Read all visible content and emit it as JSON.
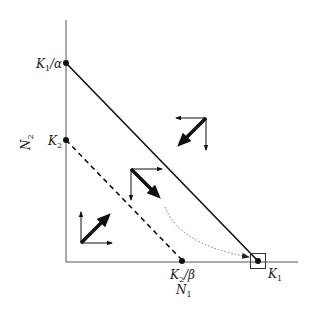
{
  "diagram": {
    "type": "phase-plane",
    "colors": {
      "ink": "#111111",
      "axis": "#555555",
      "dotted": "#666666"
    },
    "axes": {
      "x_label": {
        "main": "N",
        "sub": "1"
      },
      "y_label": {
        "main": "N",
        "sub": "2"
      }
    },
    "points": {
      "k1_over_alpha": {
        "main": "K",
        "sub": "1",
        "tail": "/α"
      },
      "k2": {
        "main": "K",
        "sub": "2"
      },
      "k2_over_beta": {
        "main": "K",
        "sub": "2",
        "tail": "/β"
      },
      "k1": {
        "main": "K",
        "sub": "1"
      }
    },
    "isoclines": [
      {
        "name": "species-1-isocline",
        "style": "solid",
        "from": "K1/α",
        "to": "K1"
      },
      {
        "name": "species-2-isocline",
        "style": "dashed",
        "from": "K2",
        "to": "K2/β"
      }
    ],
    "vector_clusters": [
      {
        "region": "above both isoclines",
        "resultant": "down-left"
      },
      {
        "region": "between isoclines",
        "resultant": "down-right"
      },
      {
        "region": "below both isoclines",
        "resultant": "up-right"
      }
    ],
    "equilibrium": {
      "label": "K1",
      "stable": true,
      "marker": "box"
    }
  }
}
